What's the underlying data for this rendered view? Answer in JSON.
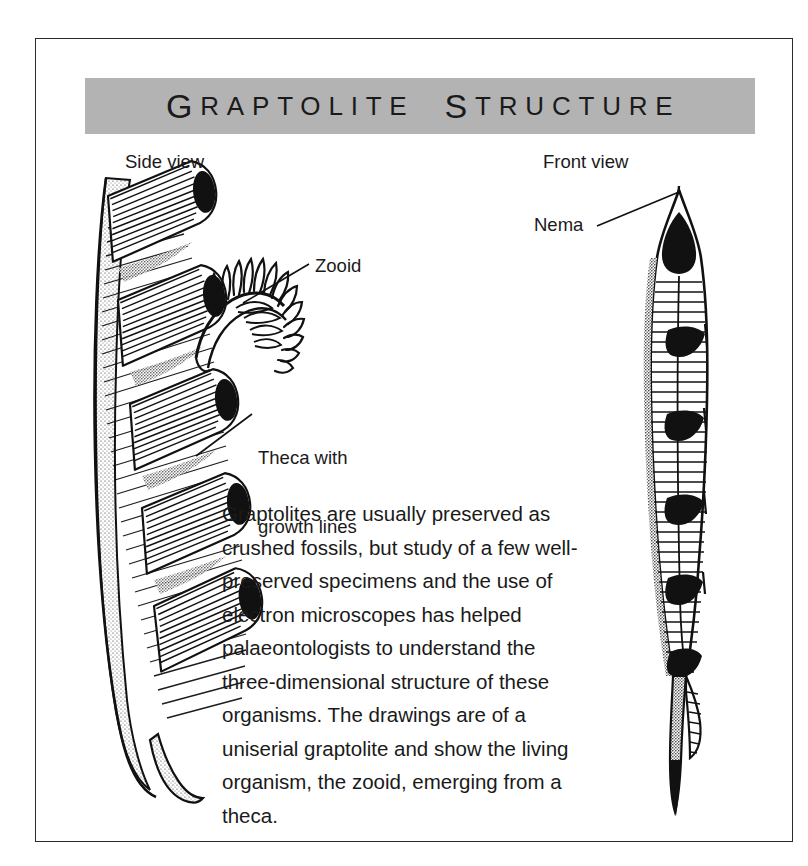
{
  "figure": {
    "title_words": [
      "GRAPTOLITE",
      "STRUCTURE"
    ],
    "frame_border_color": "#2b2b2b",
    "title_band_color": "#b3b3b3",
    "ink_color": "#1a1a1a",
    "paper_color": "#ffffff"
  },
  "captions": {
    "side_view": "Side view",
    "front_view": "Front view"
  },
  "callouts": {
    "zooid": "Zooid",
    "theca_line1": "Theca with",
    "theca_line2": "growth lines",
    "nema": "Nema"
  },
  "body": {
    "paragraph": "Graptolites are usually preserved as crushed fossils, but study of a few well-preserved specimens and the use of electron microscopes has helped palaeontologists to understand the three-dimensional structure of these organisms. The drawings are of a uniserial graptolite and show the living organism, the zooid, emerging from a theca."
  },
  "illustrations": {
    "side_view": {
      "name": "uniserial-graptolite-side-view",
      "features": [
        "overlapping thecae",
        "growth lines",
        "dark apertures",
        "zooid with tentacles",
        "tapering curved tail"
      ],
      "theca_count": 5
    },
    "front_view": {
      "name": "uniserial-graptolite-front-view",
      "features": [
        "nema at apex",
        "stacked thecae",
        "crescent apertures",
        "fine growth lines",
        "pointed distal tip"
      ],
      "theca_count": 6
    }
  }
}
